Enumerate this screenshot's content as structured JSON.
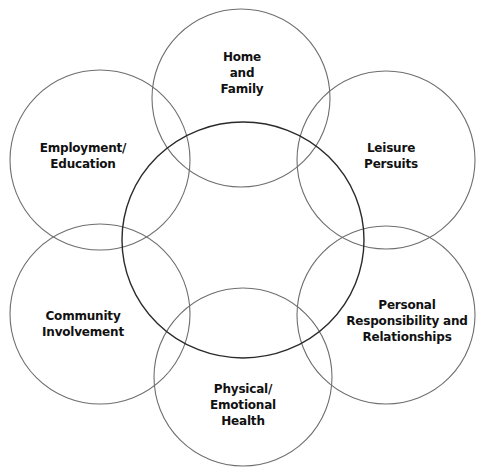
{
  "diagram": {
    "type": "overlapping-circles",
    "colors": {
      "background": "#ffffff",
      "outer_stroke": "#6e6e6e",
      "center_stroke": "#2a2a2a",
      "text": "#111111"
    },
    "center": {
      "cx": 243,
      "cy": 240,
      "rx": 121,
      "ry": 118,
      "label": ""
    },
    "circles": [
      {
        "id": "home",
        "cx": 241,
        "cy": 98,
        "r": 89,
        "lines": [
          "Home",
          "and",
          "Family"
        ],
        "text_x": 242,
        "text_y": 49
      },
      {
        "id": "leisure",
        "cx": 386,
        "cy": 160,
        "r": 89,
        "lines": [
          "Leisure",
          "Persuits"
        ],
        "text_x": 391,
        "text_y": 140
      },
      {
        "id": "personal",
        "cx": 386,
        "cy": 315,
        "r": 89,
        "lines": [
          "Personal",
          "Responsibility and",
          "Relationships"
        ],
        "text_x": 407,
        "text_y": 297
      },
      {
        "id": "physical",
        "cx": 243,
        "cy": 377,
        "r": 89,
        "lines": [
          "Physical/",
          "Emotional",
          "Health"
        ],
        "text_x": 243,
        "text_y": 381
      },
      {
        "id": "community",
        "cx": 100,
        "cy": 314,
        "r": 90,
        "lines": [
          "Community",
          "Involvement"
        ],
        "text_x": 83,
        "text_y": 308
      },
      {
        "id": "employment",
        "cx": 100,
        "cy": 160,
        "r": 90,
        "lines": [
          "Employment/",
          "Education"
        ],
        "text_x": 83,
        "text_y": 140
      }
    ]
  }
}
